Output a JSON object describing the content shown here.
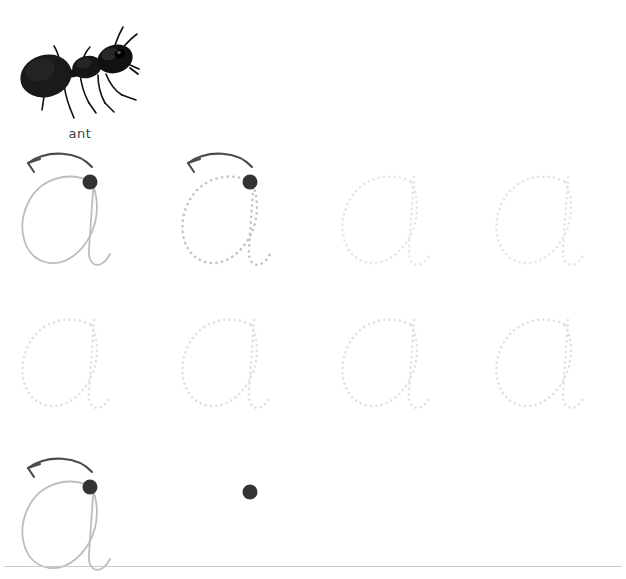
{
  "worksheet": {
    "title": "Letter a handwriting tracing practice worksheet",
    "background_color": "#ffffff",
    "width": 626,
    "height": 579,
    "letter": "a"
  },
  "illustration": {
    "icon_name": "ant-photo",
    "alt": "black ant",
    "word_label": "ant",
    "label_color": "#3f3f3f"
  },
  "colors": {
    "solid_guide_stroke": "#bdbdbd",
    "dotted_strong_stroke": "#c3c0c6",
    "dotted_faint_stroke": "#e6e4e8",
    "start_dot_fill": "#333333",
    "arrow_stroke": "#4a4a4a",
    "baseline": "#c9c9c9"
  },
  "rows": [
    {
      "row_name": "row-1",
      "slots": [
        {
          "slot_name": "letter-slot-1-1",
          "style": "solid",
          "stroke": "#bdbdbd",
          "has_start_dot": true,
          "has_arrow": true,
          "has_letter": true
        },
        {
          "slot_name": "letter-slot-1-2",
          "style": "dotted-strong",
          "stroke": "#c3c0c6",
          "has_start_dot": true,
          "has_arrow": true,
          "has_letter": true
        },
        {
          "slot_name": "letter-slot-1-3",
          "style": "dotted-faint",
          "stroke": "#e6e4e8",
          "has_start_dot": false,
          "has_arrow": false,
          "has_letter": true
        },
        {
          "slot_name": "letter-slot-1-4",
          "style": "dotted-faint",
          "stroke": "#e6e4e8",
          "has_start_dot": false,
          "has_arrow": false,
          "has_letter": true
        }
      ]
    },
    {
      "row_name": "row-2",
      "slots": [
        {
          "slot_name": "letter-slot-2-1",
          "style": "dotted-faint",
          "stroke": "#e2e0e4",
          "has_start_dot": false,
          "has_arrow": false,
          "has_letter": true
        },
        {
          "slot_name": "letter-slot-2-2",
          "style": "dotted-faint",
          "stroke": "#e2e0e4",
          "has_start_dot": false,
          "has_arrow": false,
          "has_letter": true
        },
        {
          "slot_name": "letter-slot-2-3",
          "style": "dotted-faint",
          "stroke": "#e2e0e4",
          "has_start_dot": false,
          "has_arrow": false,
          "has_letter": true
        },
        {
          "slot_name": "letter-slot-2-4",
          "style": "dotted-faint",
          "stroke": "#e2e0e4",
          "has_start_dot": false,
          "has_arrow": false,
          "has_letter": true
        }
      ]
    },
    {
      "row_name": "row-3",
      "slots": [
        {
          "slot_name": "letter-slot-3-1",
          "style": "solid",
          "stroke": "#bdbdbd",
          "has_start_dot": true,
          "has_arrow": true,
          "has_letter": true
        },
        {
          "slot_name": "letter-slot-3-2",
          "style": "none",
          "stroke": "#ffffff",
          "has_start_dot": true,
          "has_arrow": false,
          "has_letter": false
        },
        {
          "slot_name": "letter-slot-3-3",
          "style": "none",
          "stroke": "#ffffff",
          "has_start_dot": false,
          "has_arrow": false,
          "has_letter": false
        },
        {
          "slot_name": "letter-slot-3-4",
          "style": "none",
          "stroke": "#ffffff",
          "has_start_dot": false,
          "has_arrow": false,
          "has_letter": false
        }
      ],
      "has_baseline": true
    }
  ]
}
